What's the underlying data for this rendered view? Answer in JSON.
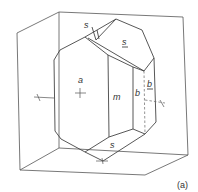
{
  "figure": {
    "caption": "(a)",
    "labels": {
      "face_a": "a",
      "face_m": "m",
      "face_b": "b",
      "face_b_back": "b",
      "face_s_top_back": "s",
      "face_s_top_front": "s",
      "face_s_bottom": "s"
    },
    "colors": {
      "line": "#444444",
      "background": "#ffffff"
    }
  }
}
